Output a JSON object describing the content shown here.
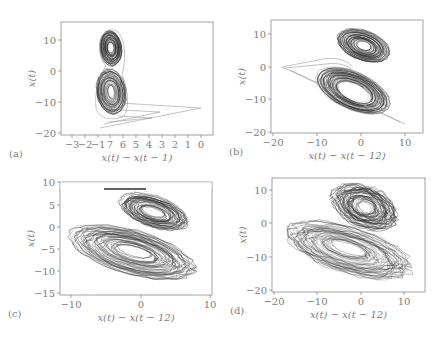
{
  "chart_data": [
    {
      "id": "a",
      "type": "line",
      "panel_label": "(a)",
      "title": "",
      "xlabel": "x(t) − x(t − 1)",
      "ylabel": "x(t)",
      "x_tick_labels": [
        "−3",
        "−2",
        "−1",
        "7",
        "6",
        "5",
        "4",
        "3",
        "2",
        "1",
        "0"
      ],
      "y_tick_labels": [
        "10",
        "0",
        "−10",
        "−20"
      ],
      "y_ticks": [
        10,
        0,
        -10,
        -20
      ],
      "ylim": [
        -21,
        14
      ],
      "grid": false,
      "description": "Double-loop (figure-eight) attractor reconstruction with transient legs to the right",
      "frame": {
        "x": 61,
        "y": 22,
        "w": 152,
        "h": 113
      },
      "y_tick_px": [
        40,
        71,
        102,
        133
      ],
      "x_tick_px": [
        72,
        85,
        98,
        110,
        123,
        136,
        149,
        162,
        175,
        188,
        201
      ]
    },
    {
      "id": "b",
      "type": "line",
      "panel_label": "(b)",
      "title": "",
      "xlabel": "x(t) − x(t − 12)",
      "ylabel": "x(t)",
      "x_tick_labels": [
        "−20",
        "−10",
        "0",
        "10"
      ],
      "x_ticks": [
        -20,
        -10,
        0,
        10
      ],
      "y_tick_labels": [
        "10",
        "0",
        "−10",
        "−20"
      ],
      "y_ticks": [
        10,
        0,
        -10,
        -20
      ],
      "xlim": [
        -20.5,
        13
      ],
      "ylim": [
        -20.5,
        14
      ],
      "grid": false,
      "description": "Two-lobe attractor, upper lobe centered near (0, 7), lower lobe near (0, -7)",
      "frame": {
        "x": 271,
        "y": 20,
        "w": 152,
        "h": 113
      },
      "y_tick_px": [
        34,
        67,
        99,
        132
      ],
      "x_tick_px": [
        273,
        317,
        361,
        405
      ]
    },
    {
      "id": "c",
      "type": "line",
      "panel_label": "(c)",
      "title": "",
      "xlabel": "x(t) − x(t − 12)",
      "ylabel": "x(t)",
      "x_tick_labels": [
        "−10",
        "0",
        "10"
      ],
      "x_ticks": [
        -10,
        0,
        10
      ],
      "y_tick_labels": [
        "10",
        "5",
        "0",
        "−5",
        "−10",
        "−15"
      ],
      "y_ticks": [
        10,
        5,
        0,
        -5,
        -10,
        -15
      ],
      "xlim": [
        -11,
        10
      ],
      "ylim": [
        -15,
        10
      ],
      "grid": false,
      "description": "Noisier two-lobe attractor; upper lobe flattened near x(t)=8",
      "frame": {
        "x": 60,
        "y": 182,
        "w": 152,
        "h": 113
      },
      "y_tick_px": [
        182,
        205,
        227,
        249,
        271,
        293
      ],
      "x_tick_px": [
        71,
        141,
        210
      ]
    },
    {
      "id": "d",
      "type": "line",
      "panel_label": "(d)",
      "title": "",
      "xlabel": "x(t) − x(t − 12)",
      "ylabel": "x(t)",
      "x_tick_labels": [
        "−20",
        "−10",
        "0",
        "10"
      ],
      "x_ticks": [
        -20,
        -10,
        0,
        10
      ],
      "y_tick_labels": [
        "10",
        "0",
        "−10",
        "−20"
      ],
      "y_ticks": [
        10,
        0,
        -10,
        -20
      ],
      "xlim": [
        -20.5,
        15
      ],
      "ylim": [
        -20.5,
        13
      ],
      "grid": false,
      "description": "Highly noisy attractor, dense tangle centered near (0, 3)",
      "frame": {
        "x": 272,
        "y": 178,
        "w": 153,
        "h": 114
      },
      "y_tick_px": [
        190,
        223,
        257,
        290
      ],
      "x_tick_px": [
        274,
        317,
        361,
        404
      ]
    }
  ],
  "style": {
    "trajectory_color": "#2f2f2f",
    "faint_color": "#9a9a9a",
    "axis_color": "#8a8a8a",
    "text_color": "#7d7d7d"
  }
}
